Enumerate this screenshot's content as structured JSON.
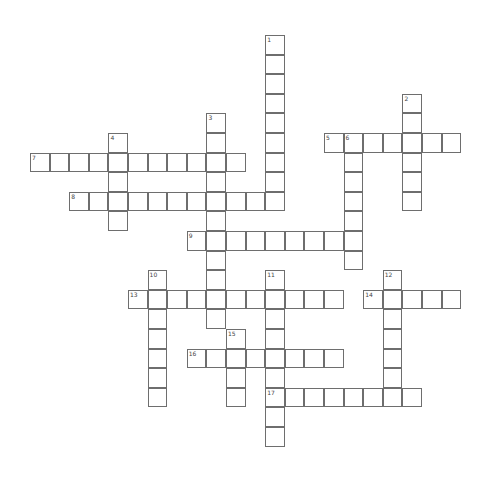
{
  "puzzle": {
    "type": "crossword",
    "cell_size": 19.6,
    "origin": {
      "x": 30,
      "y": 35
    },
    "line_color": "#6e6e6e",
    "entries": [
      {
        "number": "1",
        "direction": "down",
        "row": 0,
        "col": 12,
        "length": 9
      },
      {
        "number": "2",
        "direction": "down",
        "row": 3,
        "col": 19,
        "length": 6
      },
      {
        "number": "3",
        "direction": "down",
        "row": 4,
        "col": 9,
        "length": 11
      },
      {
        "number": "4",
        "direction": "down",
        "row": 5,
        "col": 4,
        "length": 5
      },
      {
        "number": "5",
        "direction": "across",
        "row": 5,
        "col": 15,
        "length": 7
      },
      {
        "number": "6",
        "direction": "down",
        "row": 5,
        "col": 16,
        "length": 7
      },
      {
        "number": "7",
        "direction": "across",
        "row": 6,
        "col": 0,
        "length": 11
      },
      {
        "number": "8",
        "direction": "across",
        "row": 8,
        "col": 2,
        "length": 11
      },
      {
        "number": "9",
        "direction": "across",
        "row": 10,
        "col": 8,
        "length": 9
      },
      {
        "number": "10",
        "direction": "down",
        "row": 12,
        "col": 6,
        "length": 7
      },
      {
        "number": "11",
        "direction": "down",
        "row": 12,
        "col": 12,
        "length": 9
      },
      {
        "number": "12",
        "direction": "down",
        "row": 12,
        "col": 18,
        "length": 7
      },
      {
        "number": "13",
        "direction": "across",
        "row": 13,
        "col": 5,
        "length": 11
      },
      {
        "number": "14",
        "direction": "across",
        "row": 13,
        "col": 17,
        "length": 5
      },
      {
        "number": "15",
        "direction": "down",
        "row": 15,
        "col": 10,
        "length": 4
      },
      {
        "number": "16",
        "direction": "across",
        "row": 16,
        "col": 8,
        "length": 8
      },
      {
        "number": "17",
        "direction": "across",
        "row": 18,
        "col": 12,
        "length": 8
      }
    ]
  }
}
